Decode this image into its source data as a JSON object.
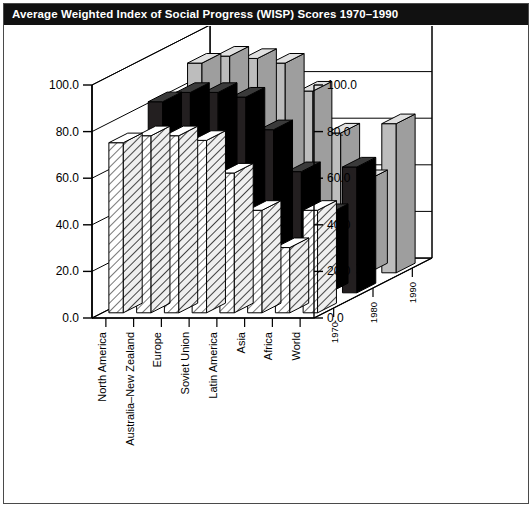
{
  "window": {
    "title": "Average Weighted Index of Social Progress (WISP) Scores 1970–1990"
  },
  "chart_data": {
    "type": "bar",
    "subtype": "3d-grouped-bar",
    "title": "Average Weighted Index of Social Progress (WISP) Scores 1970–1990",
    "xlabel": "",
    "ylabel": "",
    "zlabel": "",
    "ylim": [
      0.0,
      100.0
    ],
    "ytick_step": 20.0,
    "grid": true,
    "legend": "none",
    "axes": {
      "left_ticks": [
        "0.0",
        "20.0",
        "40.0",
        "60.0",
        "80.0",
        "100.0"
      ],
      "right_ticks": [
        "0.0",
        "20.0",
        "40.0",
        "60.0",
        "80.0",
        "100.0"
      ]
    },
    "categories": [
      "North America",
      "Australia–New Zealand",
      "Europe",
      "Soviet Union",
      "Latin America",
      "Asia",
      "Africa",
      "World"
    ],
    "depth_categories": [
      "1970",
      "1980",
      "1990"
    ],
    "series": [
      {
        "name": "1970",
        "fill": "hatch",
        "values": [
          73.0,
          76.0,
          76.0,
          74.0,
          60.0,
          44.0,
          28.0,
          44.0
        ]
      },
      {
        "name": "1980",
        "fill": "dark",
        "values": [
          82.0,
          86.0,
          86.0,
          84.0,
          70.0,
          52.0,
          34.0,
          54.0
        ]
      },
      {
        "name": "1990",
        "fill": "light",
        "values": [
          90.0,
          93.0,
          92.0,
          90.0,
          78.0,
          60.0,
          40.0,
          64.0
        ]
      }
    ],
    "colors": {
      "series_1970": "#f2f2f2",
      "series_1980": "#231f20",
      "series_1990": "#bdbdbd",
      "outline": "#000000",
      "title_bar": "#111111",
      "title_text": "#ffffff",
      "frame": "#4a4a4a"
    }
  }
}
